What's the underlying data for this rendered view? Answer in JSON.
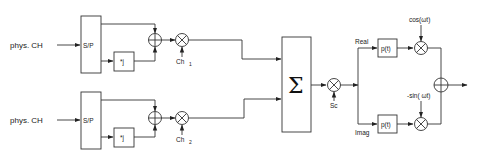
{
  "diagram": {
    "type": "block-diagram",
    "branches": [
      {
        "input_label": "phys. CH",
        "sp_label": "S/P",
        "imag_mult_label": "*j",
        "channel_label": "Ch",
        "channel_sub": "1"
      },
      {
        "input_label": "phys. CH",
        "sp_label": "S/P",
        "imag_mult_label": "*j",
        "channel_label": "Ch",
        "channel_sub": "2"
      }
    ],
    "sum_symbol": "Σ",
    "scrambling_label": "Sc",
    "real_label": "Real",
    "imag_label": "Imag",
    "pulse_shape_real": "p(t)",
    "pulse_shape_imag": "p(t)",
    "carrier_cos": "cos(ωt)",
    "carrier_sin": "-sin( ωt)"
  }
}
